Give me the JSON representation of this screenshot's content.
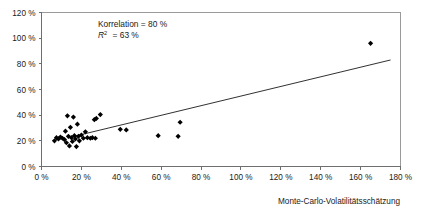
{
  "chart_data": {
    "type": "scatter",
    "title": "",
    "xlabel": "Monte-Carlo-Volatilitätsschätzung",
    "ylabel": "",
    "xlim": [
      0,
      180
    ],
    "ylim": [
      0,
      120
    ],
    "grid": false,
    "legend": null,
    "xticks": [
      "0 %",
      "20 %",
      "40 %",
      "60 %",
      "80 %",
      "100 %",
      "120 %",
      "140 %",
      "160 %",
      "180 %"
    ],
    "xtick_values": [
      0,
      20,
      40,
      60,
      80,
      100,
      120,
      140,
      160,
      180
    ],
    "yticks": [
      "0 %",
      "20 %",
      "40 %",
      "60 %",
      "80 %",
      "100 %",
      "120 %"
    ],
    "ytick_values": [
      0,
      20,
      40,
      60,
      80,
      100,
      120
    ],
    "marker_shape": "diamond",
    "marker_color": "#000000",
    "points": [
      [
        6.5,
        20.0
      ],
      [
        7.5,
        22.5
      ],
      [
        8.5,
        21.5
      ],
      [
        9.5,
        23.0
      ],
      [
        10.5,
        22.0
      ],
      [
        11.5,
        21.0
      ],
      [
        12.0,
        27.5
      ],
      [
        12.5,
        18.5
      ],
      [
        13.0,
        39.5
      ],
      [
        13.5,
        23.5
      ],
      [
        14.0,
        16.0
      ],
      [
        14.5,
        30.5
      ],
      [
        15.0,
        22.5
      ],
      [
        15.5,
        19.5
      ],
      [
        16.0,
        38.5
      ],
      [
        16.5,
        24.0
      ],
      [
        17.0,
        21.5
      ],
      [
        17.5,
        15.5
      ],
      [
        18.0,
        33.0
      ],
      [
        18.5,
        23.5
      ],
      [
        19.0,
        20.0
      ],
      [
        20.0,
        24.5
      ],
      [
        21.0,
        22.0
      ],
      [
        22.0,
        27.0
      ],
      [
        23.0,
        22.5
      ],
      [
        24.5,
        22.0
      ],
      [
        25.5,
        22.5
      ],
      [
        26.5,
        36.5
      ],
      [
        27.0,
        22.0
      ],
      [
        27.5,
        37.5
      ],
      [
        29.5,
        40.5
      ],
      [
        39.5,
        29.0
      ],
      [
        42.5,
        28.5
      ],
      [
        58.5,
        24.0
      ],
      [
        68.5,
        23.5
      ],
      [
        69.5,
        34.5
      ],
      [
        165.0,
        96.0
      ]
    ],
    "trendline": {
      "x_start": 15.0,
      "y_start": 23.0,
      "x_end": 175.0,
      "y_end": 83.0
    },
    "annotations": [
      {
        "text": "Korrelation = 80 %",
        "x": 42,
        "y": 112
      },
      {
        "text": "R² = 63 %",
        "x": 42,
        "y": 104
      }
    ],
    "annotation_lines": {
      "correlation_label": "Korrelation",
      "correlation_eq": "=",
      "correlation_value": "80 %",
      "r2_label": "R",
      "r2_sup": "2",
      "r2_eq": "=",
      "r2_value": "63 %"
    }
  }
}
